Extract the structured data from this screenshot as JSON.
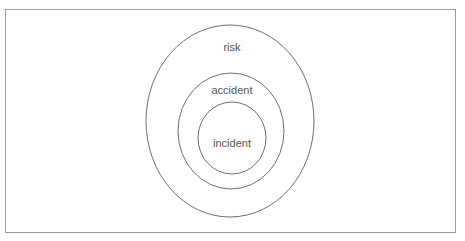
{
  "diagram": {
    "type": "nested-ellipses",
    "stroke_color": "#6e6e6e",
    "frame_color": "#9a9a9a",
    "text_color": "#555555",
    "layers": [
      {
        "label": "risk",
        "cx": 230,
        "cy": 121,
        "rx": 84,
        "ry": 96,
        "label_x": 232,
        "label_y": 51
      },
      {
        "label": "accident",
        "cx": 231,
        "cy": 131,
        "rx": 53,
        "ry": 58,
        "label_x": 232,
        "label_y": 94
      },
      {
        "label": "incident",
        "cx": 232,
        "cy": 138,
        "rx": 34,
        "ry": 36,
        "label_x": 232,
        "label_y": 147
      }
    ]
  }
}
